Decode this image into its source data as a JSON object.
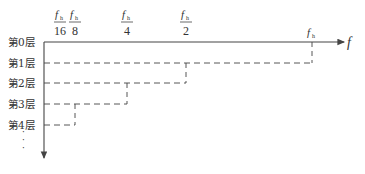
{
  "diagram": {
    "title": "",
    "axis_x_label": "f",
    "symbol": "f",
    "subscript": "h",
    "frequency_marks": [
      {
        "numerator": "f",
        "sub": "h",
        "denominator": "16"
      },
      {
        "numerator": "f",
        "sub": "h",
        "denominator": "8"
      },
      {
        "numerator": "f",
        "sub": "h",
        "denominator": "4"
      },
      {
        "numerator": "f",
        "sub": "h",
        "denominator": "2"
      },
      {
        "numerator": "f",
        "sub": "h",
        "denominator": ""
      }
    ],
    "layers": [
      "第0层",
      "第1层",
      "第2层",
      "第3层",
      "第4层"
    ],
    "layer_extents": [
      4,
      3,
      2,
      1
    ],
    "continuation": "⋮",
    "colors": {
      "line": "#444444",
      "text": "#333333"
    }
  }
}
